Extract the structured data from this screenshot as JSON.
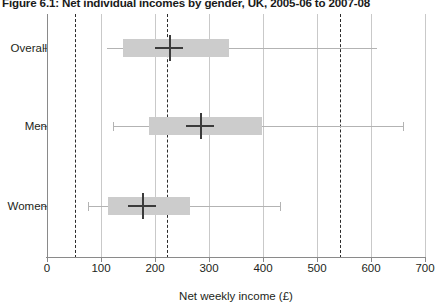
{
  "title": "Figure 6.1: Net individual incomes by gender, UK, 2005-06 to 2007-08",
  "chart_data": {
    "type": "boxplot",
    "title": "Figure 6.1: Net individual incomes by gender, UK, 2005-06 to 2007-08",
    "xlabel": "Net weekly income (£)",
    "ylabel": "",
    "xlim": [
      0,
      700
    ],
    "xticks": [
      0,
      100,
      200,
      300,
      400,
      500,
      600,
      700
    ],
    "xtick_labels": [
      "0",
      "100",
      "200",
      "300",
      "400",
      "500",
      "600",
      "700"
    ],
    "grid": "vertical-gridlines-at-xticks",
    "legend": "none",
    "reference_lines": [
      {
        "name": "lower-reference-line",
        "value": 52,
        "style": "dashed"
      },
      {
        "name": "middle-reference-line",
        "value": 222,
        "style": "dashed"
      },
      {
        "name": "upper-reference-line",
        "value": 543,
        "style": "dashed"
      }
    ],
    "categories": [
      "Overall",
      "Men",
      "Women"
    ],
    "boxes": [
      {
        "category": "Overall",
        "whisker_low": 112,
        "q1": 141,
        "median": 226,
        "q3": 337,
        "whisker_high": 612,
        "cap_low": false,
        "cap_high": false
      },
      {
        "category": "Men",
        "whisker_low": 189,
        "q1": 189,
        "median": 283,
        "q3": 398,
        "whisker_high": 660,
        "cap_low": true,
        "cap_high": true,
        "whisker_low_tip": 122
      },
      {
        "category": "Women",
        "whisker_low": 76,
        "q1": 113,
        "median": 176,
        "q3": 265,
        "whisker_high": 432,
        "cap_low": true,
        "cap_high": true
      }
    ],
    "colors": {
      "box_fill": "#cccccc",
      "median_line": "#3b3b3b",
      "whisker": "#b3b3b3",
      "gridline": "#c9c9c9",
      "axis": "#8a8a8a",
      "reference_line": "#2b2b2b",
      "text": "#231f20",
      "background": "#ffffff"
    }
  }
}
